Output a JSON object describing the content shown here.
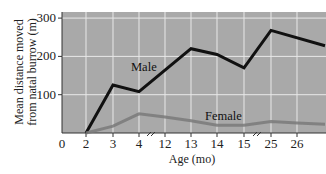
{
  "chart_data": {
    "type": "line",
    "title": "",
    "xlabel": "Age (mo)",
    "ylabel": "Mean distance moved from natal burrow (m)",
    "ylabel_lines": [
      "Mean distance moved",
      "from natal burrow (m)"
    ],
    "x_tick_labels": [
      "0",
      "2",
      "3",
      "4",
      "12",
      "13",
      "14",
      "15",
      "25",
      "26"
    ],
    "y_tick_labels": [
      "100",
      "200",
      "300"
    ],
    "ylim": [
      0,
      320
    ],
    "grid": true,
    "axis_breaks": [
      "between 4 and 12",
      "between 15 and 25"
    ],
    "x": [
      2,
      3,
      4,
      12,
      13,
      14,
      15,
      25,
      26,
      27
    ],
    "series": [
      {
        "name": "Male",
        "color": "#111111",
        "values": [
          0,
          125,
          108,
          165,
          220,
          205,
          170,
          268,
          248,
          228
        ]
      },
      {
        "name": "Female",
        "color": "#7a7a7a",
        "values": [
          0,
          18,
          50,
          42,
          32,
          20,
          20,
          30,
          26,
          23
        ]
      }
    ],
    "legend": "inline labels"
  },
  "labels": {
    "male": "Male",
    "female": "Female",
    "xlabel": "Age (mo)",
    "ylabel1": "Mean distance moved",
    "ylabel2": "from natal burrow (m)"
  },
  "colors": {
    "plot_bg": "#a9a9a9",
    "grid": "#e8e8e8",
    "male": "#111111",
    "female": "#7a7a7a"
  }
}
